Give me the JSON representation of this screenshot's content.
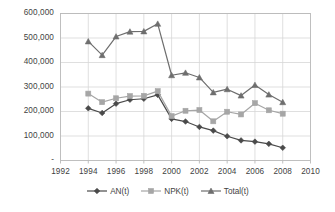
{
  "chart_data": {
    "type": "line",
    "title": "",
    "xlabel": "",
    "ylabel": "",
    "x": [
      1994,
      1995,
      1996,
      1997,
      1998,
      1999,
      2000,
      2001,
      2002,
      2003,
      2004,
      2005,
      2006,
      2007,
      2008
    ],
    "xlim": [
      1992,
      2010
    ],
    "ylim": [
      0,
      600000
    ],
    "xticks": [
      1992,
      1994,
      1996,
      1998,
      2000,
      2002,
      2004,
      2006,
      2008,
      2010
    ],
    "xtick_labels": [
      "1992",
      "1994",
      "1996",
      "1998",
      "2000",
      "2002",
      "2004",
      "2006",
      "2008",
      "2010"
    ],
    "yticks": [
      0,
      100000,
      200000,
      300000,
      400000,
      500000,
      600000
    ],
    "ytick_labels": [
      "-",
      "100,000",
      "200,000",
      "300,000",
      "400,000",
      "500,000",
      "600,000"
    ],
    "grid": true,
    "legend_position": "bottom",
    "series": [
      {
        "name": "AN(t)",
        "marker": "diamond",
        "color": "#4a4a4a",
        "values": [
          213000,
          194000,
          232000,
          248000,
          252000,
          268000,
          170000,
          159000,
          137000,
          122000,
          99000,
          82000,
          77000,
          68000,
          52000
        ]
      },
      {
        "name": "NPK(t)",
        "marker": "square",
        "color": "#a6a6a6",
        "values": [
          273000,
          238000,
          254000,
          263000,
          264000,
          283000,
          181000,
          203000,
          206000,
          160000,
          199000,
          188000,
          234000,
          205000,
          191000
        ]
      },
      {
        "name": "Total(t)",
        "marker": "triangle",
        "color": "#6e6e6e",
        "values": [
          486000,
          430000,
          506000,
          526000,
          527000,
          558000,
          348000,
          358000,
          339000,
          278000,
          291000,
          265000,
          308000,
          269000,
          238000
        ]
      }
    ]
  },
  "axes": {
    "frame_color": "#b9b9b9",
    "grid_color": "#d7d7d7",
    "background": "#ffffff"
  }
}
